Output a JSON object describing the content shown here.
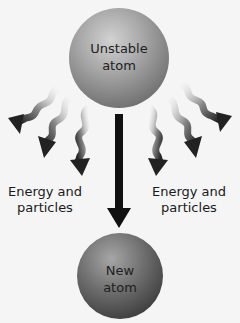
{
  "diagram": {
    "top_atom": {
      "line1": "Unstable",
      "line2": "atom"
    },
    "bottom_atom": {
      "line1": "New",
      "line2": "atom"
    },
    "left_label": {
      "line1": "Energy and",
      "line2": "particles"
    },
    "right_label": {
      "line1": "Energy and",
      "line2": "particles"
    },
    "colors": {
      "background": "#f5f5f5",
      "top_atom": "#9a9a9a",
      "bottom_atom": "#6e6e6e",
      "arrow": "#111111",
      "wavy_arrow_dark": "#2a2a2a",
      "wavy_arrow_light": "#f0f0f0"
    }
  }
}
